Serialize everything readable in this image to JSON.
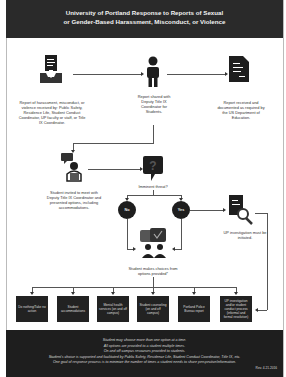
{
  "header": {
    "title_line1": "University of Portland Response to Reports of Sexual",
    "title_line2": "or Gender-Based Harassment, Misconduct, or Violence"
  },
  "nodes": {
    "report": {
      "icon": "inbox-document-icon",
      "caption": "Report of harassment, misconduct, or violence received by: Public Safety, Residence Life, Student Conduct Coordinator, UP faculty or staff, or Title IX Coordinator."
    },
    "shared": {
      "icon": "person-icon",
      "caption": "Report shared with Deputy Title IX Coordinator for Students."
    },
    "documented": {
      "icon": "document-icon",
      "caption": "Report received and documented as required by the US Department of Education."
    },
    "invited": {
      "icon": "meeting-person-icon",
      "caption": "Student invited to meet with Deputy Title IX Coordinator and presented options, including accommodations."
    },
    "threat": {
      "icon": "question-bubble-icon",
      "caption": "Imminent threat?"
    },
    "no": {
      "label": "No"
    },
    "yes": {
      "label": "Yes"
    },
    "investigation": {
      "icon": "document-magnifier-icon",
      "caption": "UP investigation must be initiated."
    },
    "choice": {
      "icon": "people-chat-icon",
      "caption": "Student makes choices from options provided*"
    }
  },
  "options": [
    "Do nothing/Take no action",
    "Student accommodations",
    "Mental health services (on and off campus)",
    "Student counseling (on and off campus)",
    "Portland Police Bureau report",
    "UP investigation and/or student conduct process (informal and formal resolution)"
  ],
  "footer": {
    "lines": [
      "Student may choose more than one option at a time.",
      "All options are provided to a student multiple times.",
      "On and off campus resources provided to students.",
      "Student's choice is supported and facilitated by Public Safety, Residence Life, Student Conduct Coordinator, Title IX, etc.",
      "One goal of response process is to minimize the number of times a student needs to share perspective/information."
    ],
    "revision": "Rev. 4.21.2016"
  },
  "colors": {
    "header_bg": "#2a2a2a",
    "footer_bg": "#1e1e1e",
    "box_bg": "#222222",
    "icon": "#1e1e1e",
    "line": "#555555"
  }
}
